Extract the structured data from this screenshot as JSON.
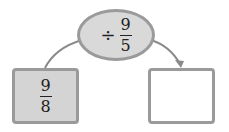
{
  "operation": {
    "operator": "÷",
    "numerator": "9",
    "denominator": "5"
  },
  "input_box": {
    "numerator": "9",
    "denominator": "8"
  },
  "output_box": {
    "value": ""
  },
  "colors": {
    "fill": "#d9d9d9",
    "border": "#9a9a9a",
    "line": "#8a8a8a"
  }
}
